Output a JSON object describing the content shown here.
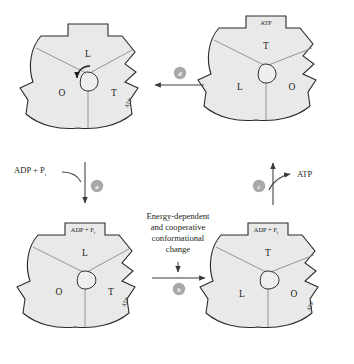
{
  "diagram": {
    "states": [
      {
        "id": "top-left",
        "position": "top-left",
        "top_notch_label": "",
        "side_notch_label": "ATP",
        "site_labels": {
          "top": "L",
          "left": "O",
          "right": "T"
        },
        "rotation_arrow": true
      },
      {
        "id": "top-right",
        "position": "top-right",
        "top_notch_label": "ATP",
        "side_notch_label": "",
        "site_labels": {
          "top": "T",
          "left": "L",
          "right": "O"
        },
        "rotation_arrow": false
      },
      {
        "id": "bottom-left",
        "position": "bottom-left",
        "top_notch_label": "ADP + P",
        "top_notch_subscript": "i",
        "side_notch_label": "ATP",
        "site_labels": {
          "top": "L",
          "left": "O",
          "right": "T"
        },
        "rotation_arrow": false
      },
      {
        "id": "bottom-right",
        "position": "bottom-right",
        "top_notch_label": "ADP + P",
        "top_notch_subscript": "i",
        "side_notch_label": "ATP",
        "site_labels": {
          "top": "T",
          "left": "L",
          "right": "O"
        },
        "rotation_arrow": false
      }
    ],
    "steps": [
      {
        "key": "a",
        "label": "a",
        "direction": "down",
        "edge": "left"
      },
      {
        "key": "b",
        "label": "b",
        "direction": "right",
        "edge": "bottom"
      },
      {
        "key": "c",
        "label": "c",
        "direction": "up",
        "edge": "right"
      },
      {
        "key": "d",
        "label": "d",
        "direction": "left",
        "edge": "top"
      }
    ],
    "annotations": {
      "substrate_in": "ADP + P",
      "substrate_in_subscript": "i",
      "product_out": "ATP",
      "center_caption_lines": [
        "Energy-dependent",
        "and cooperative",
        "conformational",
        "change"
      ]
    },
    "colors": {
      "enzyme_fill": "#e9e9e9",
      "enzyme_stroke": "#2b2b2b",
      "divider": "#8a8a8a",
      "badge": "#a8a8a8",
      "text": "#231f20",
      "background": "#ffffff"
    }
  }
}
